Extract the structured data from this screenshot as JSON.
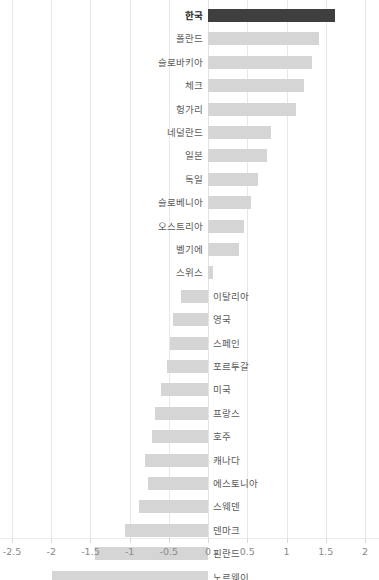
{
  "chart_data": {
    "type": "bar",
    "orientation": "horizontal",
    "title": "",
    "subtitle": "",
    "xlabel": "",
    "ylabel": "",
    "xlim": [
      -2.5,
      2.0
    ],
    "xticks": [
      -2.5,
      -2,
      -1.5,
      -1,
      -0.5,
      0,
      0.5,
      1,
      1.5,
      2
    ],
    "xticklabels": [
      "-2.5",
      "-2",
      "-1.5",
      "-1",
      "-0.5",
      "0",
      "0.5",
      "1",
      "1.5",
      "2"
    ],
    "grid": true,
    "legend": false,
    "highlight_category": "한국",
    "colors": {
      "bar": "#d5d5d5",
      "highlight_bar": "#3f3f3f",
      "gridline": "#e8e8e8",
      "label": "#5a5a5a",
      "highlight_label": "#1a1a1a",
      "tick_label": "#8a8a8a",
      "background": "#ffffff"
    },
    "categories": [
      "한국",
      "폴란드",
      "슬로바키아",
      "체크",
      "헝가리",
      "네덜란드",
      "일본",
      "독일",
      "슬로베니아",
      "오스트리아",
      "벨기에",
      "스위스",
      "이탈리아",
      "영국",
      "스페인",
      "포르투갈",
      "미국",
      "프랑스",
      "호주",
      "캐나다",
      "에스토니아",
      "스웨덴",
      "덴마크",
      "핀란드",
      "노르웨이"
    ],
    "values": [
      1.62,
      1.41,
      1.33,
      1.22,
      1.12,
      0.8,
      0.75,
      0.63,
      0.55,
      0.46,
      0.4,
      0.06,
      -0.35,
      -0.45,
      -0.48,
      -0.53,
      -0.6,
      -0.68,
      -0.71,
      -0.8,
      -0.76,
      -0.88,
      -1.06,
      -1.44,
      -1.99
    ]
  }
}
